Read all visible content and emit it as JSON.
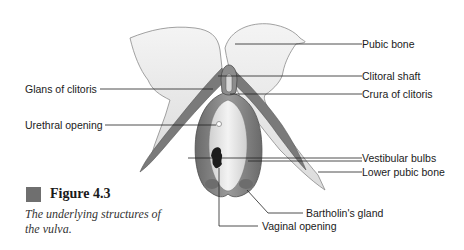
{
  "figure": {
    "number_label": "Figure 4.3",
    "caption": "The underlying structures of the vulva.",
    "accent_color": "#6f6f6f"
  },
  "labels": {
    "pubic_bone": "Pubic bone",
    "clitoral_shaft": "Clitoral shaft",
    "glans_of_clitoris": "Glans of clitoris",
    "crura_of_clitoris": "Crura of clitoris",
    "urethral_opening": "Urethral opening",
    "vestibular_bulbs": "Vestibular bulbs",
    "lower_pubic_bone": "Lower pubic bone",
    "bartholins_gland": "Bartholin's gland",
    "vaginal_opening": "Vaginal opening"
  }
}
